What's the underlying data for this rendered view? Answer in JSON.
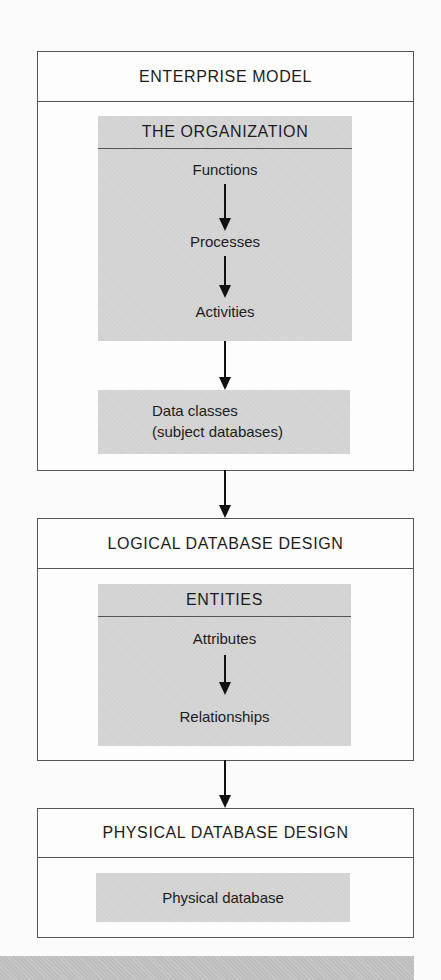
{
  "diagram": {
    "stages": [
      {
        "title": "ENTERPRISE MODEL",
        "section_title": "THE ORGANIZATION",
        "steps": [
          "Functions",
          "Processes",
          "Activities"
        ],
        "output": [
          "Data classes",
          "(subject databases)"
        ]
      },
      {
        "title": "LOGICAL DATABASE DESIGN",
        "section_title": "ENTITIES",
        "steps": [
          "Attributes",
          "Relationships"
        ]
      },
      {
        "title": "PHYSICAL DATABASE DESIGN",
        "output": [
          "Physical database"
        ]
      }
    ],
    "colors": {
      "frame_border": "#555555",
      "shaded_fill": "#d2d2d2",
      "arrow": "#111111",
      "bottom_band": "#bdbdbd"
    }
  }
}
